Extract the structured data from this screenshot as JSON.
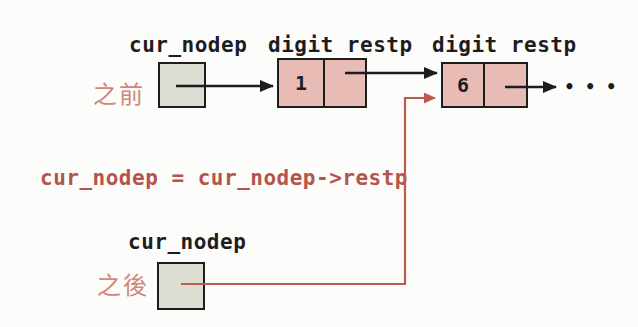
{
  "figure": {
    "state_before": {
      "label": "之前",
      "pointer": {
        "name": "cur_nodep"
      },
      "nodes": [
        {
          "header": "digit restp",
          "digit": "1"
        },
        {
          "header": "digit restp",
          "digit": "6"
        }
      ],
      "ellipsis": "•••"
    },
    "code": "cur_nodep = cur_nodep->restp",
    "state_after": {
      "label": "之後",
      "pointer": {
        "name": "cur_nodep"
      }
    },
    "colors": {
      "node_fill": "#e8bcb4",
      "pointer_fill": "#dcded4",
      "line_black": "#1d1d1d",
      "line_red": "#c05a50",
      "state_label": "#d08878",
      "code_text": "#b5544c"
    }
  }
}
